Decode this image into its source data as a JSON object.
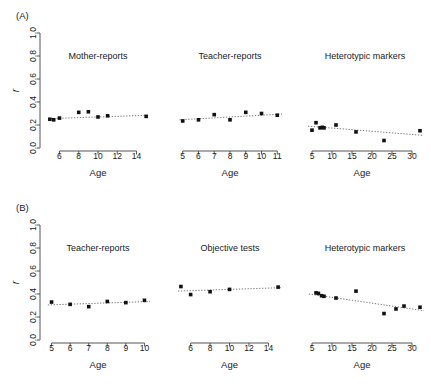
{
  "figure": {
    "width": 431,
    "height": 384,
    "background": "#ffffff",
    "marker_color": "#111111",
    "line_color": "#777777",
    "axis_color": "#555555",
    "panel_letters": [
      "(A)",
      "(B)"
    ],
    "y_axis_label": "r",
    "x_axis_label": "Age",
    "y_ticks": [
      "0.0",
      "0.2",
      "0.4",
      "0.6",
      "0.8",
      "1.0"
    ],
    "y_tick_values": [
      0.0,
      0.2,
      0.4,
      0.6,
      0.8,
      1.0
    ],
    "ylim": [
      0.0,
      1.0
    ]
  },
  "chart_data": [
    {
      "type": "scatter",
      "panel": "(A)",
      "index": 0,
      "title": "Mother-reports",
      "xlabel": "Age",
      "ylabel": "r",
      "ylim": [
        0.0,
        1.0
      ],
      "xlim": [
        4.6,
        15.4
      ],
      "xticks": [
        6,
        8,
        10,
        12,
        14
      ],
      "xtick_labels": [
        "6",
        "8",
        "10",
        "12",
        "14"
      ],
      "grid": false,
      "legend": "none",
      "x": [
        5.0,
        5.4,
        6.0,
        8.0,
        9.0,
        10.0,
        11.0,
        15.0
      ],
      "y": [
        0.25,
        0.245,
        0.26,
        0.31,
        0.315,
        0.27,
        0.28,
        0.275
      ],
      "trend": {
        "x0": 4.8,
        "y0": 0.255,
        "x1": 15.3,
        "y1": 0.285,
        "style": "dotted"
      }
    },
    {
      "type": "scatter",
      "panel": "(A)",
      "index": 1,
      "title": "Teacher-reports",
      "xlabel": "Age",
      "ylabel": "r",
      "ylim": [
        0.0,
        1.0
      ],
      "xlim": [
        4.7,
        11.3
      ],
      "xticks": [
        5,
        6,
        7,
        8,
        9,
        10,
        11
      ],
      "xtick_labels": [
        "5",
        "6",
        "7",
        "8",
        "9",
        "10",
        "11"
      ],
      "grid": false,
      "legend": "none",
      "x": [
        5.0,
        6.0,
        7.0,
        8.0,
        9.0,
        10.0,
        11.0
      ],
      "y": [
        0.235,
        0.245,
        0.29,
        0.245,
        0.31,
        0.3,
        0.285
      ],
      "trend": {
        "x0": 4.8,
        "y0": 0.245,
        "x1": 11.3,
        "y1": 0.295,
        "style": "dotted"
      }
    },
    {
      "type": "scatter",
      "panel": "(A)",
      "index": 2,
      "title": "Heterotypic markers",
      "xlabel": "Age",
      "ylabel": "r",
      "ylim": [
        0.0,
        1.0
      ],
      "xlim": [
        3.5,
        33.0
      ],
      "xticks": [
        5,
        10,
        15,
        20,
        25,
        30
      ],
      "xtick_labels": [
        "5",
        "10",
        "15",
        "20",
        "25",
        "30"
      ],
      "grid": false,
      "legend": "none",
      "x": [
        5.0,
        6.0,
        7.0,
        7.6,
        8.0,
        11.0,
        16.0,
        23.0,
        32.0
      ],
      "y": [
        0.155,
        0.22,
        0.175,
        0.18,
        0.175,
        0.2,
        0.14,
        0.065,
        0.15
      ],
      "trend": {
        "x0": 4.0,
        "y0": 0.19,
        "x1": 32.8,
        "y1": 0.11,
        "style": "dotted"
      }
    },
    {
      "type": "scatter",
      "panel": "(B)",
      "index": 0,
      "title": "Teacher-reports",
      "xlabel": "Age",
      "ylabel": "r",
      "ylim": [
        0.0,
        1.0
      ],
      "xlim": [
        4.7,
        10.3
      ],
      "xticks": [
        5,
        6,
        7,
        8,
        9,
        10
      ],
      "xtick_labels": [
        "5",
        "6",
        "7",
        "8",
        "9",
        "10"
      ],
      "grid": false,
      "legend": "none",
      "x": [
        5.0,
        6.0,
        7.0,
        8.0,
        9.0,
        10.0
      ],
      "y": [
        0.33,
        0.31,
        0.29,
        0.335,
        0.325,
        0.345
      ],
      "trend": {
        "x0": 4.8,
        "y0": 0.305,
        "x1": 10.3,
        "y1": 0.335,
        "style": "dotted"
      }
    },
    {
      "type": "scatter",
      "panel": "(B)",
      "index": 1,
      "title": "Objective tests",
      "xlabel": "Age",
      "ylabel": "r",
      "ylim": [
        0.0,
        1.0
      ],
      "xlim": [
        4.7,
        15.4
      ],
      "xticks": [
        6,
        8,
        10,
        12,
        14
      ],
      "xtick_labels": [
        "6",
        "8",
        "10",
        "12",
        "14"
      ],
      "grid": false,
      "legend": "none",
      "x": [
        5.0,
        6.0,
        8.0,
        10.0,
        15.0
      ],
      "y": [
        0.465,
        0.395,
        0.42,
        0.44,
        0.46
      ],
      "trend": {
        "x0": 4.7,
        "y0": 0.425,
        "x1": 15.3,
        "y1": 0.455,
        "style": "dotted"
      }
    },
    {
      "type": "scatter",
      "panel": "(B)",
      "index": 2,
      "title": "Heterotypic markers",
      "xlabel": "Age",
      "ylabel": "r",
      "ylim": [
        0.0,
        1.0
      ],
      "xlim": [
        3.5,
        33.0
      ],
      "xticks": [
        5,
        10,
        15,
        20,
        25,
        30
      ],
      "xtick_labels": [
        "5",
        "10",
        "15",
        "20",
        "25",
        "30"
      ],
      "grid": false,
      "legend": "none",
      "x": [
        6.0,
        6.6,
        7.4,
        8.0,
        11.0,
        16.0,
        23.0,
        26.0,
        28.0,
        32.0
      ],
      "y": [
        0.41,
        0.405,
        0.385,
        0.38,
        0.365,
        0.425,
        0.23,
        0.27,
        0.295,
        0.285
      ],
      "trend": {
        "x0": 4.2,
        "y0": 0.4,
        "x1": 33.0,
        "y1": 0.255,
        "style": "dotted"
      }
    }
  ]
}
